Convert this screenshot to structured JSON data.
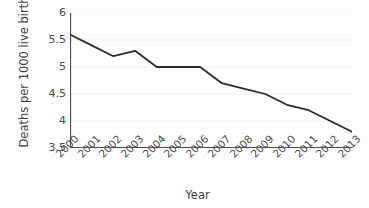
{
  "chart_data": {
    "type": "line",
    "title": "",
    "xlabel": "Year",
    "ylabel": "Deaths per 1000 live births",
    "categories": [
      "2000",
      "2001",
      "2002",
      "2003",
      "2004",
      "2005",
      "2006",
      "2007",
      "2008",
      "2009",
      "2010",
      "2011",
      "2012",
      "2013"
    ],
    "x": [
      2000,
      2001,
      2002,
      2003,
      2004,
      2005,
      2006,
      2007,
      2008,
      2009,
      2010,
      2011,
      2012,
      2013
    ],
    "values": [
      5.6,
      5.4,
      5.2,
      5.3,
      5.0,
      5.0,
      5.0,
      4.7,
      4.6,
      4.5,
      4.3,
      4.2,
      4.0,
      3.8
    ],
    "series": [
      {
        "name": "Deaths per 1000 live births",
        "values": [
          5.6,
          5.4,
          5.2,
          5.3,
          5.0,
          5.0,
          5.0,
          4.7,
          4.6,
          4.5,
          4.3,
          4.2,
          4.0,
          3.8
        ],
        "color": "#2b2b2b"
      }
    ],
    "ylim": [
      3.5,
      6
    ],
    "xlim": [
      2000,
      2013
    ],
    "yticks": [
      3.5,
      4,
      4.5,
      5,
      5.5,
      6
    ],
    "ytick_labels": [
      "3.5",
      "4",
      "4.5",
      "5",
      "5.5",
      "6"
    ],
    "xtick_labels": [
      "2000",
      "2001",
      "2002",
      "2003",
      "2004",
      "2005",
      "2006",
      "2007",
      "2008",
      "2009",
      "2010",
      "2011",
      "2012",
      "2013"
    ],
    "grid": true,
    "grid_axis": "y",
    "grid_color": "#f2f2f2",
    "legend": false,
    "legend_position": "none",
    "axis_color": "#4a4a4a",
    "background_color": "#ffffff",
    "line_color": "#2b2b2b",
    "line_width": 1.8,
    "markers": false,
    "xtick_rotation": -45,
    "spines": [
      "left",
      "bottom"
    ]
  }
}
